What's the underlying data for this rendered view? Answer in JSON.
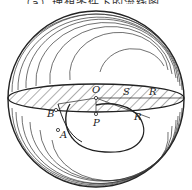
{
  "caption": "（a）理想条件下的流线图",
  "labels": {
    "O": "O",
    "S": "S",
    "R_top": "R",
    "P": "P",
    "R_bottom": "R",
    "B": "B",
    "A": "A"
  },
  "colors": {
    "stroke": "#222222",
    "background": "#ffffff"
  }
}
